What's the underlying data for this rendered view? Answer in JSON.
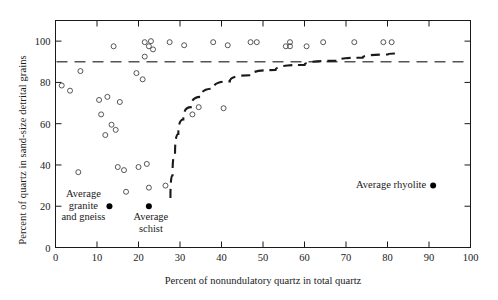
{
  "chart_data": {
    "type": "scatter",
    "title": "",
    "xlabel": "Percent of nonundulatory quartz in total quartz",
    "ylabel": "Percent of quartz in sand-size detrital grains",
    "xlim": [
      0,
      100
    ],
    "ylim": [
      0,
      110
    ],
    "grid": false,
    "legend": "none",
    "xticks": [
      0,
      10,
      20,
      30,
      40,
      50,
      60,
      70,
      80,
      90,
      100
    ],
    "yticks": [
      0,
      20,
      40,
      60,
      80,
      100
    ],
    "series": [
      {
        "name": "sandstone samples",
        "marker": "open-circle",
        "points": [
          [
            1.5,
            78.5
          ],
          [
            3.5,
            76
          ],
          [
            6.0,
            85.5
          ],
          [
            5.5,
            36.5
          ],
          [
            10.5,
            71.5
          ],
          [
            11.0,
            64.5
          ],
          [
            12.5,
            73
          ],
          [
            12.0,
            54.5
          ],
          [
            13.5,
            59.5
          ],
          [
            14.5,
            57
          ],
          [
            15.5,
            70.5
          ],
          [
            14.0,
            97.5
          ],
          [
            15.0,
            39
          ],
          [
            16.5,
            37.5
          ],
          [
            17.0,
            27
          ],
          [
            20.0,
            39
          ],
          [
            19.5,
            84.5
          ],
          [
            21.0,
            81.5
          ],
          [
            22.0,
            40.5
          ],
          [
            22.5,
            29
          ],
          [
            21.5,
            99.5
          ],
          [
            22.5,
            97.5
          ],
          [
            21.5,
            92.5
          ],
          [
            23.5,
            96
          ],
          [
            23.0,
            100
          ],
          [
            26.5,
            30
          ],
          [
            27.5,
            99.5
          ],
          [
            31.0,
            98
          ],
          [
            33.0,
            64.5
          ],
          [
            34.5,
            68
          ],
          [
            38.0,
            99.5
          ],
          [
            40.5,
            67.5
          ],
          [
            41.5,
            98
          ],
          [
            47.0,
            99.5
          ],
          [
            48.5,
            99.5
          ],
          [
            55.5,
            97.5
          ],
          [
            56.5,
            99.5
          ],
          [
            56.5,
            97.5
          ],
          [
            60.5,
            97.5
          ],
          [
            64.5,
            99.5
          ],
          [
            72.0,
            99.5
          ],
          [
            79.0,
            99.5
          ],
          [
            81.0,
            99.5
          ]
        ]
      },
      {
        "name": "reference rock averages",
        "marker": "filled-circle",
        "points": [
          {
            "x": 13.0,
            "y": 20.0,
            "label": "Average granite and gneiss"
          },
          {
            "x": 22.5,
            "y": 20.0,
            "label": "Average schist"
          },
          {
            "x": 91.0,
            "y": 30.0,
            "label": "Average rhyolite"
          }
        ]
      }
    ],
    "annotations": [
      {
        "name": "average-granite-and-gneiss",
        "text": "Average\ngranite\nand gneiss",
        "x": 13.0,
        "y": 20.0
      },
      {
        "name": "average-schist",
        "text": "Average\nschist",
        "x": 22.5,
        "y": 20.0
      },
      {
        "name": "average-rhyolite",
        "text": "Average rhyolite",
        "x": 91.0,
        "y": 30.0
      }
    ],
    "reference_lines": [
      {
        "name": "ninety-percent-line",
        "orientation": "horizontal",
        "value": 90,
        "style": "dashed",
        "color": "#555555"
      },
      {
        "name": "boundary-curve",
        "orientation": "curve",
        "style": "dashed-thick",
        "color": "#1a1a1a",
        "points": [
          [
            27.7,
            24
          ],
          [
            28.2,
            35
          ],
          [
            28.8,
            45
          ],
          [
            29.6,
            55
          ],
          [
            30.8,
            62
          ],
          [
            32.6,
            68
          ],
          [
            35,
            73
          ],
          [
            38,
            77
          ],
          [
            42,
            80.5
          ],
          [
            47,
            83.5
          ],
          [
            53,
            86
          ],
          [
            60,
            88.5
          ],
          [
            68,
            90.5
          ],
          [
            74,
            92
          ],
          [
            80,
            93.5
          ],
          [
            82,
            94
          ]
        ]
      }
    ]
  },
  "axes": {
    "x_title": "Percent of nonundulatory quartz in total quartz",
    "y_title": "Percent of quartz in sand-size detrital grains",
    "x_tick_labels": [
      "0",
      "10",
      "20",
      "30",
      "40",
      "50",
      "60",
      "70",
      "80",
      "90",
      "100"
    ],
    "y_tick_labels": [
      "0",
      "20",
      "40",
      "60",
      "80",
      "100"
    ]
  },
  "annotation_labels": {
    "granite_line1": "Average",
    "granite_line2": "granite",
    "granite_line3": "and gneiss",
    "schist_line1": "Average",
    "schist_line2": "schist",
    "rhyolite": "Average rhyolite"
  },
  "colors": {
    "axis": "#1a1a1a",
    "marker_outline": "#444444",
    "marker_fill_solid": "#000000",
    "dashed_reference": "#555555",
    "curve": "#1a1a1a",
    "background": "#ffffff"
  }
}
